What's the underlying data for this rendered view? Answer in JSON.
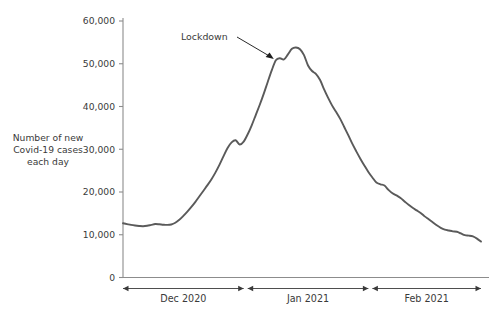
{
  "chart_data": {
    "type": "line",
    "title": "",
    "xlabel": "",
    "ylabel": "Number of new Covid-19 cases each day",
    "ylabel_lines": [
      "Number of new",
      "Covid-19 cases",
      "each day"
    ],
    "ylim": [
      0,
      60000
    ],
    "ytick_values": [
      0,
      10000,
      20000,
      30000,
      40000,
      50000,
      60000
    ],
    "ytick_labels": [
      "0",
      "10,000",
      "20,000",
      "30,000",
      "40,000",
      "50,000",
      "60,000"
    ],
    "grid": false,
    "legend": "none",
    "line_color": "#5a5a5a",
    "axis_color": "#8c8c8c",
    "x_ranges": [
      {
        "label": "Dec 2020",
        "start": 0,
        "end": 30
      },
      {
        "label": "Jan 2021",
        "start": 31,
        "end": 61
      },
      {
        "label": "Feb 2021",
        "start": 62,
        "end": 89
      }
    ],
    "annotations": [
      {
        "label": "Lockdown",
        "x": 38,
        "y": 51000
      }
    ],
    "x": [
      0,
      1,
      2,
      3,
      4,
      5,
      6,
      7,
      8,
      9,
      10,
      11,
      12,
      13,
      14,
      15,
      16,
      17,
      18,
      19,
      20,
      21,
      22,
      23,
      24,
      25,
      26,
      27,
      28,
      29,
      30,
      31,
      32,
      33,
      34,
      35,
      36,
      37,
      38,
      39,
      40,
      41,
      42,
      43,
      44,
      45,
      46,
      47,
      48,
      49,
      50,
      51,
      52,
      53,
      54,
      55,
      56,
      57,
      58,
      59,
      60,
      61,
      62,
      63,
      64,
      65,
      66,
      67,
      68,
      69,
      70,
      71,
      72,
      73,
      74,
      75,
      76,
      77,
      78,
      79,
      80,
      81,
      82,
      83,
      84,
      85,
      86,
      87,
      88,
      89
    ],
    "values": [
      12700,
      12500,
      12300,
      12150,
      12050,
      12000,
      12100,
      12300,
      12500,
      12450,
      12350,
      12300,
      12400,
      12800,
      13500,
      14400,
      15400,
      16500,
      17700,
      19000,
      20300,
      21600,
      23000,
      24600,
      26400,
      28400,
      30300,
      31600,
      32100,
      31100,
      31800,
      33500,
      35600,
      38000,
      40400,
      43000,
      45800,
      48500,
      50800,
      51300,
      51000,
      52200,
      53500,
      53800,
      53400,
      52000,
      49600,
      48300,
      47600,
      46200,
      44000,
      42000,
      40200,
      38700,
      37100,
      35200,
      33300,
      31300,
      29500,
      27800,
      26200,
      24700,
      23400,
      22200,
      21800,
      21500,
      20500,
      19700,
      19200,
      18600,
      17800,
      17000,
      16300,
      15700,
      15100,
      14300,
      13600,
      12900,
      12200,
      11600,
      11200,
      11000,
      10800,
      10700,
      10300,
      9900,
      9800,
      9600,
      9100,
      8400
    ]
  }
}
